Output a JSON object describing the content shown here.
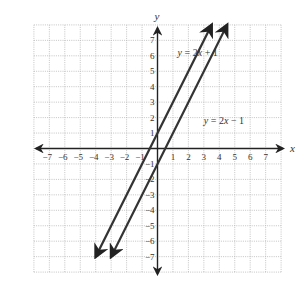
{
  "chart_data": {
    "type": "line",
    "title": "",
    "xlabel": "x",
    "ylabel": "y",
    "xlim": [
      -8,
      8
    ],
    "ylim": [
      -8,
      8
    ],
    "grid": true,
    "grid_style": "dotted",
    "x_ticks": [
      -7,
      -6,
      -5,
      -4,
      -3,
      -2,
      -1,
      1,
      2,
      3,
      4,
      5,
      6,
      7
    ],
    "y_ticks": [
      -7,
      -6,
      -5,
      -4,
      -3,
      -2,
      -1,
      1,
      2,
      3,
      4,
      5,
      6,
      7
    ],
    "x_tick_labels": [
      "−7",
      "−6",
      "−5",
      "−4",
      "−3",
      "−2",
      "−1",
      "1",
      "2",
      "3",
      "4",
      "5",
      "6",
      "7"
    ],
    "y_tick_labels": [
      "−7",
      "−6",
      "−5",
      "−4",
      "−3",
      "−2",
      "−1",
      "1",
      "2",
      "3",
      "4",
      "5",
      "6",
      "7"
    ],
    "series": [
      {
        "name": "y = 2x + 1",
        "label_parts": [
          "y",
          " = 2",
          "x",
          " + 1"
        ],
        "slope": 2,
        "intercept": 1,
        "x": [
          -4,
          3.5
        ],
        "y": [
          -7,
          8
        ],
        "arrows": "both",
        "label_pos": {
          "x": 1.3,
          "y": 6.0
        }
      },
      {
        "name": "y = 2x − 1",
        "label_parts": [
          "y",
          " = 2",
          "x",
          " − 1"
        ],
        "slope": 2,
        "intercept": -1,
        "x": [
          -3,
          4.5
        ],
        "y": [
          -7,
          8
        ],
        "arrows": "both",
        "label_pos": {
          "x": 3.0,
          "y": 1.6
        }
      }
    ],
    "line_color": "#333333",
    "grid_color": "#b5b5b5",
    "axis_color": "#222222"
  }
}
